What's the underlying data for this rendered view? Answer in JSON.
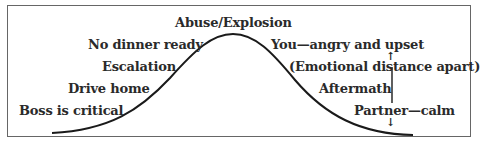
{
  "diagram": {
    "type": "cycle-of-abuse-curve",
    "peak_label": "Abuse/Explosion",
    "rising_labels": [
      "No dinner ready",
      "Escalation",
      "Drive home",
      "Boss is critical"
    ],
    "falling_labels": [
      "You—angry and upset",
      "(Emotional distance apart)",
      "Aftermath",
      "Partner—calm"
    ],
    "arrows": {
      "up": "↑",
      "down": "↓"
    },
    "colors": {
      "line": "#1a1a1a",
      "border": "#666666",
      "text": "#2a2a2a"
    }
  }
}
